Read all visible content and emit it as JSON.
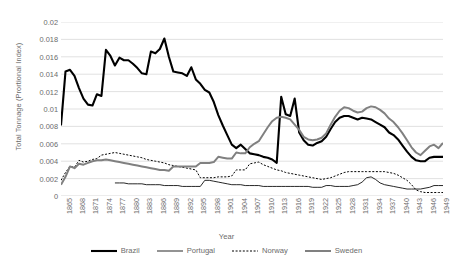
{
  "chart_data": {
    "type": "line",
    "title": "",
    "xlabel": "Year",
    "ylabel": "Total Tonnage (Prortional Index)",
    "xlim": [
      1865,
      1950
    ],
    "ylim": [
      0,
      0.02
    ],
    "grid": true,
    "legend_position": "bottom",
    "y_ticks": [
      "0",
      "0.002",
      "0.004",
      "0.006",
      "0.008",
      "0.01",
      "0.012",
      "0.014",
      "0.016",
      "0.018",
      "0.02"
    ],
    "y_tick_values": [
      0,
      0.002,
      0.004,
      0.006,
      0.008,
      0.01,
      0.012,
      0.014,
      0.016,
      0.018,
      0.02
    ],
    "x_ticks": [
      "1865",
      "1868",
      "1871",
      "1874",
      "1877",
      "1880",
      "1883",
      "1886",
      "1889",
      "1892",
      "1895",
      "1898",
      "1901",
      "1904",
      "1907",
      "1910",
      "1913",
      "1916",
      "1919",
      "1922",
      "1925",
      "1928",
      "1931",
      "1934",
      "1937",
      "1940",
      "1943",
      "1946",
      "1949"
    ],
    "x_tick_values": [
      1865,
      1868,
      1871,
      1874,
      1877,
      1880,
      1883,
      1886,
      1889,
      1892,
      1895,
      1898,
      1901,
      1904,
      1907,
      1910,
      1913,
      1916,
      1919,
      1922,
      1925,
      1928,
      1931,
      1934,
      1937,
      1940,
      1943,
      1946,
      1949
    ],
    "series": [
      {
        "name": "Brazil",
        "color": "#000000",
        "width": 2.1,
        "dash": "",
        "x": [
          1865,
          1866,
          1867,
          1868,
          1869,
          1870,
          1871,
          1872,
          1873,
          1874,
          1875,
          1876,
          1877,
          1878,
          1879,
          1880,
          1881,
          1882,
          1883,
          1884,
          1885,
          1886,
          1887,
          1888,
          1889,
          1890,
          1891,
          1892,
          1893,
          1894,
          1895,
          1896,
          1897,
          1898,
          1899,
          1900,
          1901,
          1902,
          1903,
          1904,
          1905,
          1906,
          1907,
          1908,
          1909,
          1910,
          1911,
          1912,
          1913,
          1914,
          1915,
          1916,
          1917,
          1918,
          1919,
          1920,
          1921,
          1922,
          1923,
          1924,
          1925,
          1926,
          1927,
          1928,
          1929,
          1930,
          1931,
          1932,
          1933,
          1934,
          1935,
          1936,
          1937,
          1938,
          1939,
          1940,
          1941,
          1942,
          1943,
          1944,
          1945,
          1946,
          1947,
          1948,
          1949,
          1950
        ],
        "y": [
          0.0081,
          0.0143,
          0.0145,
          0.0138,
          0.0124,
          0.0112,
          0.0105,
          0.0104,
          0.0117,
          0.0115,
          0.0168,
          0.0161,
          0.015,
          0.0159,
          0.0156,
          0.0156,
          0.0152,
          0.0147,
          0.0141,
          0.014,
          0.0166,
          0.0164,
          0.0169,
          0.0181,
          0.016,
          0.0143,
          0.0142,
          0.0141,
          0.0138,
          0.0148,
          0.0134,
          0.0129,
          0.0122,
          0.0119,
          0.0108,
          0.0093,
          0.0081,
          0.007,
          0.0059,
          0.0055,
          0.0059,
          0.0054,
          0.0049,
          0.0048,
          0.0047,
          0.0045,
          0.0044,
          0.0042,
          0.0038,
          0.0114,
          0.0094,
          0.0092,
          0.0112,
          0.0073,
          0.0064,
          0.0059,
          0.0058,
          0.0061,
          0.0063,
          0.0068,
          0.0077,
          0.0085,
          0.009,
          0.0092,
          0.0092,
          0.009,
          0.0088,
          0.009,
          0.0089,
          0.0088,
          0.0085,
          0.0082,
          0.0079,
          0.0073,
          0.007,
          0.0065,
          0.0058,
          0.0051,
          0.0045,
          0.0041,
          0.004,
          0.004,
          0.0044,
          0.0045,
          0.0045,
          0.0045
        ]
      },
      {
        "name": "Portugal",
        "color": "#000000",
        "width": 0.85,
        "dash": "",
        "x": [
          1877,
          1878,
          1879,
          1880,
          1881,
          1882,
          1883,
          1884,
          1885,
          1886,
          1887,
          1888,
          1889,
          1890,
          1891,
          1892,
          1893,
          1894,
          1895,
          1896,
          1897,
          1898,
          1899,
          1900,
          1901,
          1902,
          1903,
          1904,
          1905,
          1906,
          1907,
          1908,
          1909,
          1910,
          1911,
          1912,
          1913,
          1914,
          1915,
          1916,
          1917,
          1918,
          1919,
          1920,
          1921,
          1922,
          1923,
          1924,
          1925,
          1926,
          1927,
          1928,
          1929,
          1930,
          1931,
          1932,
          1933,
          1934,
          1935,
          1936,
          1937,
          1938,
          1939,
          1940,
          1941,
          1942,
          1943,
          1944,
          1945,
          1946,
          1947,
          1948,
          1949,
          1950
        ],
        "y": [
          0.0015,
          0.0015,
          0.0015,
          0.0014,
          0.0014,
          0.0014,
          0.0014,
          0.0013,
          0.0013,
          0.0013,
          0.0013,
          0.0012,
          0.0012,
          0.0012,
          0.0012,
          0.0011,
          0.0011,
          0.0011,
          0.0011,
          0.0011,
          0.0018,
          0.0018,
          0.0017,
          0.0016,
          0.0015,
          0.0014,
          0.0013,
          0.0013,
          0.0013,
          0.0012,
          0.0012,
          0.0012,
          0.0012,
          0.0011,
          0.0011,
          0.0011,
          0.0011,
          0.0011,
          0.0011,
          0.0011,
          0.0011,
          0.0011,
          0.0011,
          0.0011,
          0.001,
          0.001,
          0.001,
          0.0012,
          0.0012,
          0.0011,
          0.0011,
          0.0011,
          0.0011,
          0.0012,
          0.0013,
          0.0016,
          0.0021,
          0.0022,
          0.0019,
          0.0015,
          0.0013,
          0.0012,
          0.0011,
          0.001,
          0.0009,
          0.0008,
          0.0008,
          0.0008,
          0.0008,
          0.0009,
          0.001,
          0.0012,
          0.0012,
          0.0012
        ]
      },
      {
        "name": "Norway",
        "color": "#000000",
        "width": 1.0,
        "dash": "2,1.6",
        "x": [
          1865,
          1866,
          1867,
          1868,
          1869,
          1870,
          1871,
          1872,
          1873,
          1874,
          1875,
          1876,
          1877,
          1878,
          1879,
          1880,
          1881,
          1882,
          1883,
          1884,
          1885,
          1886,
          1887,
          1888,
          1889,
          1890,
          1891,
          1892,
          1893,
          1894,
          1895,
          1896,
          1897,
          1898,
          1899,
          1900,
          1901,
          1902,
          1903,
          1904,
          1905,
          1906,
          1907,
          1908,
          1909,
          1910,
          1911,
          1912,
          1913,
          1914,
          1915,
          1916,
          1917,
          1918,
          1919,
          1920,
          1921,
          1922,
          1923,
          1924,
          1925,
          1926,
          1927,
          1928,
          1929,
          1930,
          1931,
          1932,
          1933,
          1934,
          1935,
          1936,
          1937,
          1938,
          1939,
          1940,
          1941,
          1942,
          1943,
          1944,
          1945,
          1946,
          1947,
          1948,
          1949,
          1950
        ],
        "y": [
          0.0018,
          0.0027,
          0.0034,
          0.0033,
          0.0041,
          0.0039,
          0.004,
          0.0042,
          0.0043,
          0.0047,
          0.0048,
          0.0049,
          0.005,
          0.0049,
          0.0048,
          0.0047,
          0.0046,
          0.0045,
          0.0044,
          0.0042,
          0.0041,
          0.004,
          0.0039,
          0.0038,
          0.0036,
          0.0035,
          0.0034,
          0.0033,
          0.0032,
          0.0031,
          0.003,
          0.0021,
          0.0021,
          0.0021,
          0.0021,
          0.0022,
          0.0022,
          0.0022,
          0.0023,
          0.003,
          0.003,
          0.003,
          0.0037,
          0.0038,
          0.0039,
          0.0036,
          0.0034,
          0.0032,
          0.003,
          0.0029,
          0.0027,
          0.0026,
          0.0025,
          0.0024,
          0.0023,
          0.0022,
          0.0021,
          0.002,
          0.0019,
          0.002,
          0.0021,
          0.0023,
          0.0025,
          0.0027,
          0.0028,
          0.0028,
          0.0028,
          0.0028,
          0.0028,
          0.0028,
          0.0028,
          0.0028,
          0.0028,
          0.0027,
          0.0026,
          0.0024,
          0.0021,
          0.0018,
          0.0013,
          0.0007,
          0.0005,
          0.0004,
          0.0004,
          0.0004,
          0.0004,
          0.0004
        ]
      },
      {
        "name": "Sweden",
        "color": "#808080",
        "width": 2.0,
        "dash": "",
        "x": [
          1865,
          1866,
          1867,
          1868,
          1869,
          1870,
          1871,
          1872,
          1873,
          1874,
          1875,
          1876,
          1877,
          1878,
          1879,
          1880,
          1881,
          1882,
          1883,
          1884,
          1885,
          1886,
          1887,
          1888,
          1889,
          1890,
          1891,
          1892,
          1893,
          1894,
          1895,
          1896,
          1897,
          1898,
          1899,
          1900,
          1901,
          1902,
          1903,
          1904,
          1905,
          1906,
          1907,
          1908,
          1909,
          1910,
          1911,
          1912,
          1913,
          1914,
          1915,
          1916,
          1917,
          1918,
          1919,
          1920,
          1921,
          1922,
          1923,
          1924,
          1925,
          1926,
          1927,
          1928,
          1929,
          1930,
          1931,
          1932,
          1933,
          1934,
          1935,
          1936,
          1937,
          1938,
          1939,
          1940,
          1941,
          1942,
          1943,
          1944,
          1945,
          1946,
          1947,
          1948,
          1949,
          1950
        ],
        "y": [
          0.0013,
          0.0022,
          0.0034,
          0.0032,
          0.0037,
          0.0036,
          0.0038,
          0.004,
          0.0041,
          0.0041,
          0.0042,
          0.0041,
          0.004,
          0.0039,
          0.0038,
          0.0037,
          0.0036,
          0.0035,
          0.0034,
          0.0033,
          0.0032,
          0.0031,
          0.003,
          0.003,
          0.0029,
          0.0034,
          0.0034,
          0.0034,
          0.0034,
          0.0034,
          0.0034,
          0.0038,
          0.0038,
          0.0038,
          0.0039,
          0.0045,
          0.0044,
          0.0043,
          0.0043,
          0.005,
          0.0049,
          0.0049,
          0.0056,
          0.006,
          0.0063,
          0.0071,
          0.0079,
          0.0086,
          0.009,
          0.0091,
          0.009,
          0.0088,
          0.0082,
          0.0076,
          0.0068,
          0.0065,
          0.0064,
          0.0065,
          0.0067,
          0.0072,
          0.0082,
          0.0091,
          0.0098,
          0.0102,
          0.0101,
          0.0098,
          0.0096,
          0.0097,
          0.0101,
          0.0103,
          0.0102,
          0.0099,
          0.0095,
          0.0089,
          0.0085,
          0.0079,
          0.0072,
          0.0064,
          0.0056,
          0.005,
          0.0047,
          0.0052,
          0.0057,
          0.0059,
          0.0055,
          0.0061
        ]
      }
    ]
  },
  "legend": {
    "items": [
      {
        "label": "Brazil"
      },
      {
        "label": "Portugal"
      },
      {
        "label": "Norway"
      },
      {
        "label": "Sweden"
      }
    ]
  }
}
